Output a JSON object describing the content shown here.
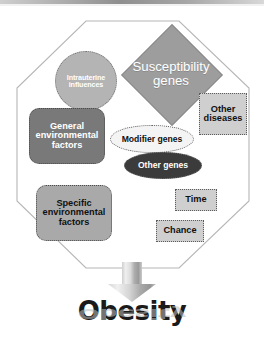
{
  "figure": {
    "outcome_label": "Obesity",
    "outcome_reflection_label": "Obesity"
  },
  "colors": {
    "canvas": "#ffffff",
    "octagon_stroke": "#b0b0b0",
    "octagon_fill": "#ffffff",
    "topbar_gradient_dark": "#8f8f8f",
    "intrauterine_fill": "#b4b4b4",
    "susceptibility_fill": "#9d9d9d",
    "other_diseases_fill": "#cfcfcf",
    "general_env_fill": "#797979",
    "modifier_genes_fill": "#f4f4f4",
    "other_genes_fill": "#3b3b3b",
    "specific_env_fill": "#a9a9a9",
    "time_fill": "#cfcfcf",
    "chance_fill": "#cfcfcf",
    "arrow_fill_light": "#e2e2e2",
    "arrow_fill_dark": "#8d8d8d",
    "obesity_text": "#1a1a1a"
  },
  "container": {
    "shape": "octagon",
    "name": "causal-framework-octagon"
  },
  "nodes": [
    {
      "id": "intrauterine-influences",
      "label": "Intrauterine influences",
      "line1": "Intrauterine",
      "line2": "influences",
      "shape": "circle",
      "fill": "#b4b4b4",
      "text_color": "#ffffff",
      "border": "dotted"
    },
    {
      "id": "susceptibility-genes",
      "label": "Susceptibility genes",
      "line1": "Susceptibility",
      "line2": "genes",
      "shape": "diamond",
      "fill": "#9d9d9d",
      "text_color": "#ffffff",
      "border": "solid"
    },
    {
      "id": "other-diseases",
      "label": "Other diseases",
      "line1": "Other",
      "line2": "diseases",
      "shape": "rectangle",
      "fill": "#cfcfcf",
      "text_color": "#111111",
      "border": "dotted"
    },
    {
      "id": "general-environmental-factors",
      "label": "General environmental factors",
      "line1": "General",
      "line2": "environmental",
      "line3": "factors",
      "shape": "rounded-rectangle",
      "fill": "#797979",
      "text_color": "#ffffff",
      "border": "dotted"
    },
    {
      "id": "modifier-genes",
      "label": "Modifier genes",
      "line1": "Modifier genes",
      "shape": "ellipse",
      "fill": "#f4f4f4",
      "text_color": "#111111",
      "border": "dotted"
    },
    {
      "id": "other-genes",
      "label": "Other genes",
      "line1": "Other genes",
      "shape": "ellipse",
      "fill": "#3b3b3b",
      "text_color": "#ffffff",
      "border": "dotted"
    },
    {
      "id": "specific-environmental-factors",
      "label": "Specific environmental factors",
      "line1": "Specific",
      "line2": "environmental",
      "line3": "factors",
      "shape": "rounded-rectangle",
      "fill": "#a9a9a9",
      "text_color": "#111111",
      "border": "dotted"
    },
    {
      "id": "time",
      "label": "Time",
      "line1": "Time",
      "shape": "rectangle",
      "fill": "#cfcfcf",
      "text_color": "#111111",
      "border": "dotted"
    },
    {
      "id": "chance",
      "label": "Chance",
      "line1": "Chance",
      "shape": "rectangle",
      "fill": "#cfcfcf",
      "text_color": "#111111",
      "border": "dotted"
    }
  ],
  "arrow": {
    "name": "down-arrow",
    "direction": "down",
    "points_to": "Obesity"
  }
}
